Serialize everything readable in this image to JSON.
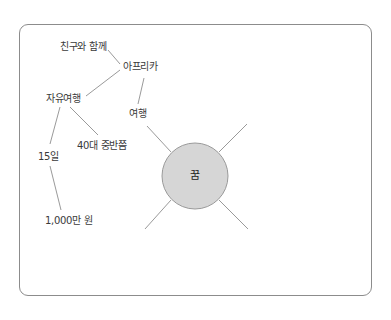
{
  "diagram": {
    "type": "mind-map",
    "center": {
      "label": "꿈",
      "fill": "#d6d6d6",
      "stroke": "#9a9a9a"
    },
    "nodes": [
      {
        "id": "with-friends",
        "label": "친구와 함께"
      },
      {
        "id": "africa",
        "label": "아프리카"
      },
      {
        "id": "free-travel",
        "label": "자유여행"
      },
      {
        "id": "travel",
        "label": "여행"
      },
      {
        "id": "mid-40s",
        "label": "40대 중반쯤"
      },
      {
        "id": "15-days",
        "label": "15일"
      },
      {
        "id": "10-million-won",
        "label": "1,000만 원"
      }
    ],
    "edges": [
      [
        "꿈",
        "여행"
      ],
      [
        "여행",
        "아프리카"
      ],
      [
        "아프리카",
        "친구와 함께"
      ],
      [
        "아프리카",
        "자유여행"
      ],
      [
        "자유여행",
        "40대 중반쯤"
      ],
      [
        "자유여행",
        "15일"
      ],
      [
        "15일",
        "1,000만 원"
      ]
    ],
    "empty_branches": 3,
    "line_color": "#9a9a9a"
  }
}
